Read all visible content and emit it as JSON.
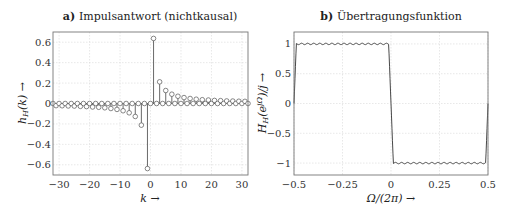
{
  "chart_data": [
    {
      "type": "stem",
      "panel_label": "a)",
      "title": "Impulsantwort (nichtkausal)",
      "xlabel": "k →",
      "ylabel": "h_H(k) →",
      "xlim": [
        -32,
        32
      ],
      "ylim": [
        -0.7,
        0.7
      ],
      "xticks": [
        -30,
        -20,
        -10,
        0,
        10,
        20,
        30
      ],
      "yticks": [
        -0.6,
        -0.4,
        -0.2,
        0,
        0.2,
        0.4,
        0.6
      ],
      "ytick_labels": [
        "−0.6",
        "−0.4",
        "−0.2",
        "0",
        "0.2",
        "0.4",
        "0.6"
      ],
      "xtick_labels": [
        "−30",
        "−20",
        "−10",
        "0",
        "10",
        "20",
        "30"
      ],
      "grid": true,
      "formula": "h(k) = 2/(pi*k) for odd k, 0 for even k",
      "k": [
        -32,
        -31,
        -30,
        -29,
        -28,
        -27,
        -26,
        -25,
        -24,
        -23,
        -22,
        -21,
        -20,
        -19,
        -18,
        -17,
        -16,
        -15,
        -14,
        -13,
        -12,
        -11,
        -10,
        -9,
        -8,
        -7,
        -6,
        -5,
        -4,
        -3,
        -2,
        -1,
        0,
        1,
        2,
        3,
        4,
        5,
        6,
        7,
        8,
        9,
        10,
        11,
        12,
        13,
        14,
        15,
        16,
        17,
        18,
        19,
        20,
        21,
        22,
        23,
        24,
        25,
        26,
        27,
        28,
        29,
        30,
        31,
        32
      ],
      "values": [
        0,
        -0.021,
        0,
        -0.022,
        0,
        -0.024,
        0,
        -0.025,
        0,
        -0.028,
        0,
        -0.03,
        0,
        -0.034,
        0,
        -0.037,
        0,
        -0.042,
        0,
        -0.049,
        0,
        -0.058,
        0,
        -0.071,
        0,
        -0.091,
        0,
        -0.127,
        0,
        -0.212,
        0,
        -0.637,
        0,
        0.637,
        0,
        0.212,
        0,
        0.127,
        0,
        0.091,
        0,
        0.071,
        0,
        0.058,
        0,
        0.049,
        0,
        0.042,
        0,
        0.037,
        0,
        0.034,
        0,
        0.03,
        0,
        0.028,
        0,
        0.025,
        0,
        0.024,
        0,
        0.022,
        0,
        0.021,
        0
      ]
    },
    {
      "type": "line",
      "panel_label": "b)",
      "title": "Übertragungsfunktion",
      "xlabel": "Ω/(2π) →",
      "ylabel": "H_H(e^{jΩ})/j →",
      "xlim": [
        -0.5,
        0.5
      ],
      "ylim": [
        -1.2,
        1.2
      ],
      "xticks": [
        -0.5,
        -0.25,
        0,
        0.25,
        0.5
      ],
      "xtick_labels": [
        "−0.5",
        "−0.25",
        "0",
        "0.25",
        "0.5"
      ],
      "yticks": [
        -1,
        -0.5,
        0,
        0.5,
        1
      ],
      "ytick_labels": [
        "−1",
        "−0.5",
        "0",
        "0.5",
        "1"
      ],
      "grid": true,
      "description": "≈ +1 for −0.5<Ω/2π<0 (with small ripple), ≈ −1 for 0<Ω/2π<0.5, steep transitions at 0 and ±0.5",
      "x": [
        -0.5,
        -0.49,
        -0.485,
        -0.25,
        -0.015,
        -0.005,
        0,
        0.005,
        0.015,
        0.25,
        0.485,
        0.49,
        0.5
      ],
      "values": [
        0,
        0.8,
        1.0,
        1.0,
        1.0,
        0.6,
        0,
        -0.6,
        -1.0,
        -1.0,
        -1.0,
        -0.8,
        0
      ]
    }
  ]
}
